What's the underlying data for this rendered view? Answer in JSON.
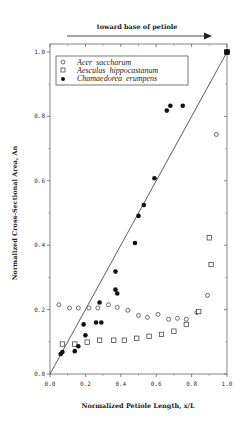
{
  "chart_data": {
    "type": "scatter",
    "title": "",
    "annotation": "toward base of petiole",
    "xlabel": "Normalized Petiole Length, x/L",
    "ylabel": "Normalized Cross-Sectional Area, An",
    "xlim": [
      0.0,
      1.0
    ],
    "ylim": [
      0.0,
      1.0
    ],
    "xticks": [
      "0.0",
      "0.2",
      "0.4",
      "0.6",
      "0.8",
      "1.0"
    ],
    "yticks": [
      "0.0",
      "0.2",
      "0.4",
      "0.6",
      "0.8",
      "1.0"
    ],
    "grid": false,
    "legend_position": "upper-left",
    "reference_line": {
      "from": [
        0.0,
        0.0
      ],
      "to": [
        1.0,
        1.0
      ]
    },
    "series": [
      {
        "name": "Acer saccharum",
        "marker": "open-circle",
        "x": [
          0.05,
          0.11,
          0.16,
          0.22,
          0.27,
          0.33,
          0.38,
          0.44,
          0.5,
          0.55,
          0.61,
          0.67,
          0.72,
          0.77,
          0.83,
          0.89,
          0.94,
          1.0
        ],
        "y": [
          0.215,
          0.205,
          0.205,
          0.205,
          0.205,
          0.215,
          0.207,
          0.198,
          0.182,
          0.176,
          0.185,
          0.17,
          0.173,
          0.17,
          0.191,
          0.244,
          0.744,
          1.0
        ]
      },
      {
        "name": "Aesculus hippocastanum",
        "marker": "open-square",
        "x": [
          0.07,
          0.14,
          0.21,
          0.28,
          0.36,
          0.42,
          0.49,
          0.56,
          0.63,
          0.7,
          0.77,
          0.84,
          0.9,
          0.91,
          1.0
        ],
        "y": [
          0.093,
          0.093,
          0.099,
          0.105,
          0.105,
          0.105,
          0.111,
          0.117,
          0.123,
          0.133,
          0.154,
          0.194,
          0.423,
          0.34,
          1.0
        ]
      },
      {
        "name": "Chamaedorea erumpens",
        "marker": "filled-circle",
        "x": [
          0.06,
          0.07,
          0.14,
          0.16,
          0.19,
          0.2,
          0.26,
          0.28,
          0.29,
          0.37,
          0.37,
          0.38,
          0.48,
          0.5,
          0.53,
          0.59,
          0.66,
          0.68,
          0.75,
          1.0
        ],
        "y": [
          0.062,
          0.068,
          0.071,
          0.086,
          0.154,
          0.12,
          0.16,
          0.222,
          0.16,
          0.318,
          0.262,
          0.25,
          0.407,
          0.491,
          0.525,
          0.608,
          0.818,
          0.833,
          0.833,
          1.0
        ]
      }
    ]
  },
  "legend": {
    "items": [
      {
        "label": "Acer  saccharum",
        "marker": "open-circle"
      },
      {
        "label": "Aesculus  hippocastanum",
        "marker": "open-square"
      },
      {
        "label": "Chamaedorea  erumpens",
        "marker": "filled-circle"
      }
    ]
  },
  "colors": {
    "ink": "#222222",
    "axis": "#555555",
    "background": "#ffffff"
  }
}
